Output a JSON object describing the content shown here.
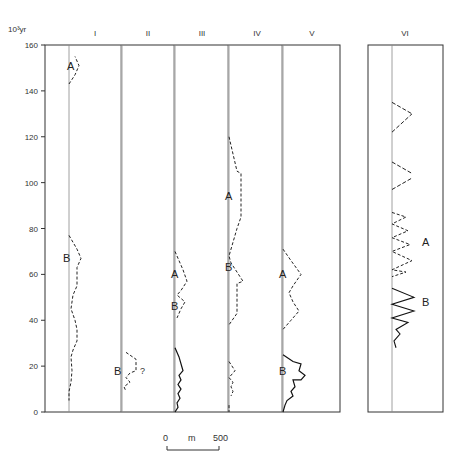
{
  "chart_data": {
    "type": "line",
    "title": "",
    "ylabel": "10³yr",
    "ylim": [
      0,
      160
    ],
    "yticks": [
      0,
      20,
      40,
      60,
      80,
      100,
      120,
      140,
      160
    ],
    "grid": false,
    "scale_bar": {
      "start": "0",
      "unit": "m",
      "end": "500"
    },
    "columns": [
      {
        "label": "I",
        "style": "dashed",
        "peaks": [
          {
            "label": "A",
            "at": 151
          },
          {
            "label": "B",
            "at": 67
          }
        ],
        "segments": [
          [
            [
              0,
              143
            ],
            [
              6,
              147
            ],
            [
              10,
              151
            ],
            [
              6,
              155
            ]
          ],
          [
            [
              0,
              77
            ],
            [
              8,
              71
            ],
            [
              12,
              67
            ],
            [
              8,
              63
            ],
            [
              8,
              55
            ],
            [
              4,
              51
            ],
            [
              2,
              45
            ],
            [
              6,
              40
            ],
            [
              8,
              36
            ],
            [
              8,
              31
            ],
            [
              4,
              27
            ],
            [
              2,
              24
            ],
            [
              3,
              18
            ],
            [
              2,
              13
            ],
            [
              0,
              9
            ],
            [
              0,
              5
            ]
          ]
        ]
      },
      {
        "label": "II",
        "style": "dashed",
        "peaks": [
          {
            "label": "B",
            "at": 18
          }
        ],
        "annotation": "?",
        "segments": [
          [
            [
              4,
              26
            ],
            [
              14,
              23
            ],
            [
              14,
              18
            ],
            [
              8,
              17
            ],
            [
              4,
              15
            ],
            [
              8,
              13
            ],
            [
              2,
              11
            ],
            [
              4,
              9
            ]
          ]
        ]
      },
      {
        "label": "III",
        "style": "dashed+solid",
        "peaks": [
          {
            "label": "A",
            "at": 58
          },
          {
            "label": "B",
            "at": 47
          }
        ],
        "segments": [
          [
            [
              0,
              70
            ],
            [
              8,
              62
            ],
            [
              12,
              57
            ],
            [
              6,
              53
            ],
            [
              2,
              51
            ],
            [
              10,
              48
            ],
            [
              6,
              45
            ],
            [
              2,
              41
            ]
          ]
        ],
        "solid": [
          [
            0,
            28
          ],
          [
            4,
            24
          ],
          [
            8,
            18
          ],
          [
            4,
            16
          ],
          [
            6,
            14
          ],
          [
            3,
            12
          ],
          [
            6,
            10
          ],
          [
            3,
            8
          ],
          [
            5,
            6
          ],
          [
            2,
            4
          ],
          [
            3,
            2
          ],
          [
            0,
            0
          ]
        ]
      },
      {
        "label": "IV",
        "style": "dashed",
        "peaks": [
          {
            "label": "A",
            "at": 94
          },
          {
            "label": "B",
            "at": 63
          }
        ],
        "segments": [
          [
            [
              0,
              120
            ],
            [
              8,
              105
            ],
            [
              12,
              104
            ],
            [
              12,
              85
            ],
            [
              8,
              80
            ],
            [
              0,
              68
            ],
            [
              2,
              65
            ],
            [
              8,
              61
            ],
            [
              14,
              57
            ],
            [
              8,
              56
            ],
            [
              8,
              43
            ],
            [
              0,
              38
            ]
          ],
          [
            [
              0,
              22
            ],
            [
              6,
              18
            ],
            [
              0,
              15
            ],
            [
              4,
              13
            ],
            [
              2,
              11
            ],
            [
              4,
              9
            ],
            [
              2,
              7
            ]
          ],
          [
            [
              0,
              3
            ],
            [
              0,
              0
            ]
          ]
        ]
      },
      {
        "label": "V",
        "style": "dashed+solid",
        "peaks": [
          {
            "label": "A",
            "at": 60
          },
          {
            "label": "B",
            "at": 19
          }
        ],
        "segments": [
          [
            [
              0,
              71
            ],
            [
              8,
              66
            ],
            [
              18,
              60
            ],
            [
              10,
              55
            ],
            [
              6,
              52
            ],
            [
              10,
              48
            ],
            [
              16,
              44
            ],
            [
              8,
              40
            ],
            [
              0,
              36
            ]
          ]
        ],
        "solid": [
          [
            0,
            25
          ],
          [
            10,
            22
          ],
          [
            18,
            21
          ],
          [
            16,
            18
          ],
          [
            22,
            16
          ],
          [
            18,
            14
          ],
          [
            10,
            14
          ],
          [
            12,
            11
          ],
          [
            8,
            9
          ],
          [
            10,
            7
          ],
          [
            4,
            5
          ],
          [
            2,
            3
          ],
          [
            0,
            0
          ]
        ]
      },
      {
        "label": "VI",
        "style": "dashed+solid",
        "peaks": [
          {
            "label": "A",
            "at": 74
          },
          {
            "label": "B",
            "at": 48
          }
        ],
        "dashed_zigzag": [
          [
            0,
            135
          ],
          [
            12,
            130
          ],
          [
            0,
            122
          ],
          [
            12,
            130
          ]
        ],
        "solid_zigzag_range": [
          28,
          56
        ]
      }
    ]
  }
}
